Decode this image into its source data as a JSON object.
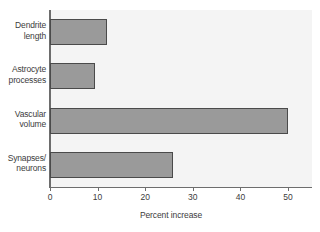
{
  "chart_data": {
    "type": "bar",
    "orientation": "horizontal",
    "title": "",
    "xlabel": "Percent increase",
    "ylabel": "",
    "categories": [
      "Dendrite length",
      "Astrocyte processes",
      "Vascular volume",
      "Synapses/ neurons"
    ],
    "category_lines": [
      [
        "Dendrite",
        "length"
      ],
      [
        "Astrocyte",
        "processes"
      ],
      [
        "Vascular",
        "volume"
      ],
      [
        "Synapses/",
        "neurons"
      ]
    ],
    "values": [
      12,
      9.5,
      50,
      25.8
    ],
    "xlim": [
      0,
      55
    ],
    "xticks": [
      0,
      10,
      20,
      30,
      40,
      50
    ],
    "xtick_labels": [
      "0",
      "10",
      "20",
      "30",
      "40",
      "50"
    ],
    "grid": false,
    "legend": null,
    "colors": {
      "bar_fill": "#9a9a9a",
      "bar_border": "#4a4a4a",
      "plot_background": "#f4f4f4",
      "axis": "#6d6d6d",
      "text": "#3c3c3c",
      "page_background": "#ffffff"
    }
  }
}
